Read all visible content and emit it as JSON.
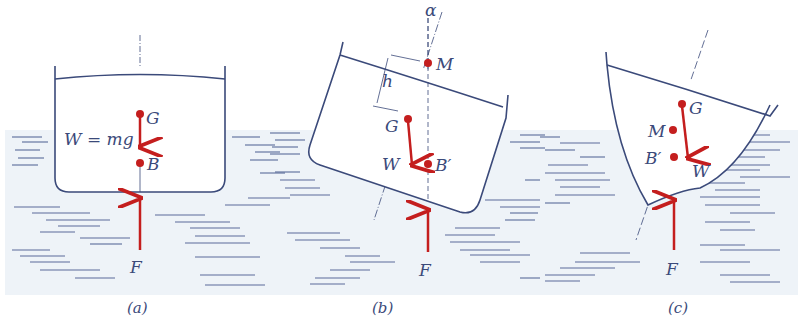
{
  "figure": {
    "colors": {
      "hull": "#3b4a7a",
      "force": "#c41e1e",
      "water_bg": "#eef3f8",
      "water_lines": "#5a6a99"
    },
    "panels": [
      {
        "id": "a",
        "caption": "(a)",
        "labels": {
          "G": "G",
          "B": "B",
          "W": "W = mg",
          "F": "F"
        }
      },
      {
        "id": "b",
        "caption": "(b)",
        "labels": {
          "alpha": "α",
          "M": "M",
          "h": "h",
          "G": "G",
          "W": "W",
          "B": "B′",
          "F": "F"
        }
      },
      {
        "id": "c",
        "caption": "(c)",
        "labels": {
          "G": "G",
          "M": "M",
          "B": "B′",
          "W": "W",
          "F": "F"
        }
      }
    ]
  }
}
